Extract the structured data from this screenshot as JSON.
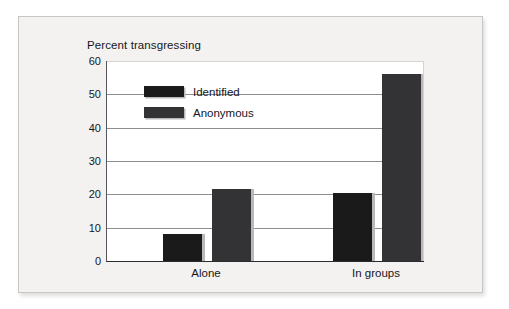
{
  "chart_data": {
    "type": "bar",
    "title": "Percent transgressing",
    "xlabel": "",
    "ylabel": "",
    "categories": [
      "Alone",
      "In groups"
    ],
    "series": [
      {
        "name": "Identified",
        "values": [
          8,
          20.5
        ],
        "color": "#1a1a1a"
      },
      {
        "name": "Anonymous",
        "values": [
          21.5,
          56
        ],
        "color": "#333336"
      }
    ],
    "ylim": [
      0,
      60
    ],
    "yticks": [
      0,
      10,
      20,
      30,
      40,
      50,
      60
    ],
    "ytick_labels": [
      "0",
      "10",
      "20",
      "30",
      "40",
      "50",
      "60"
    ],
    "grid": true,
    "legend_position": "top-left-inside"
  },
  "colors": {
    "panel_background": "#f3f2f0",
    "plot_background": "#ffffff",
    "gridline": "#8e8e92",
    "axis": "#2c2c30",
    "text": "#16161a",
    "bar_shadow": "#b9b9bb"
  }
}
